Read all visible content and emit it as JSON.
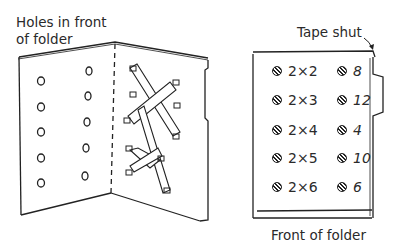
{
  "labels": {
    "holes_line1": "Holes in front",
    "holes_line2": "of folder",
    "tape": "Tape shut",
    "front": "Front of folder"
  },
  "problems": [
    {
      "expr": "2×2",
      "answer": "8"
    },
    {
      "expr": "2×3",
      "answer": "12"
    },
    {
      "expr": "2×4",
      "answer": "4"
    },
    {
      "expr": "2×5",
      "answer": "10"
    },
    {
      "expr": "2×6",
      "answer": "6"
    }
  ]
}
